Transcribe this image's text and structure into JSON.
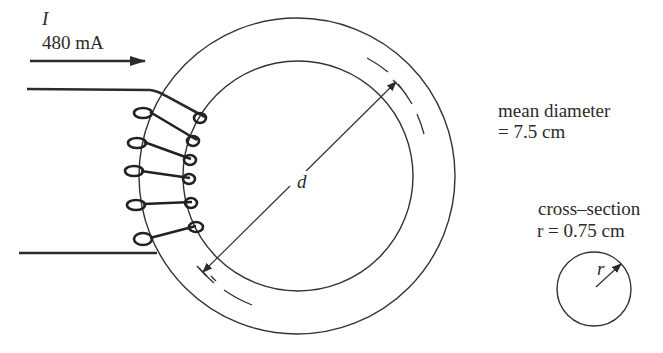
{
  "figure": {
    "current": {
      "symbol": "I",
      "value": "480 mA"
    },
    "toroid": {
      "diameter_symbol": "d",
      "mean_diameter_label": "mean diameter",
      "mean_diameter_value": "= 7.5 cm"
    },
    "cross_section": {
      "title": "cross–section",
      "radius_eq": "r = 0.75 cm",
      "radius_symbol": "r"
    },
    "colors": {
      "ink": "#2b2b2b",
      "background": "#ffffff"
    }
  }
}
